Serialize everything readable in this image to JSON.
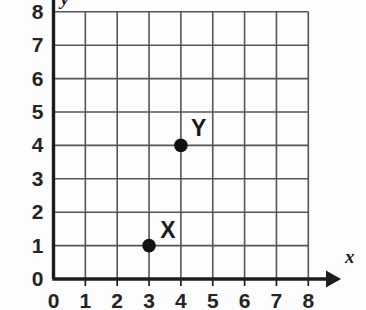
{
  "figure": {
    "kind": "coordinate-grid",
    "background_color": "#fdfdfd",
    "axis_color": "#1c1c1c",
    "grid_color": "#555555",
    "point_color": "#111111"
  },
  "chart_data": {
    "type": "scatter",
    "title": "",
    "subtitle": "",
    "xlabel": "x",
    "ylabel": "y",
    "xlim": [
      0,
      8
    ],
    "ylim": [
      0,
      8
    ],
    "xticks": [
      0,
      1,
      2,
      3,
      4,
      5,
      6,
      7,
      8
    ],
    "yticks": [
      0,
      1,
      2,
      3,
      4,
      5,
      6,
      7,
      8
    ],
    "xtick_labels": [
      "0",
      "1",
      "2",
      "3",
      "4",
      "5",
      "6",
      "7",
      "8"
    ],
    "ytick_labels": [
      "0",
      "1",
      "2",
      "3",
      "4",
      "5",
      "6",
      "7",
      "8"
    ],
    "grid": true,
    "grid_spacing": 1,
    "legend": false,
    "legend_position": "none",
    "axis_arrows": {
      "x": true,
      "y": false
    },
    "points": [
      {
        "label": "X",
        "x": 3,
        "y": 1,
        "label_dx": 0.35,
        "label_dy": 0.55
      },
      {
        "label": "Y",
        "x": 4,
        "y": 4,
        "label_dx": 0.32,
        "label_dy": 0.6
      }
    ],
    "series": [
      {
        "name": "plotted points",
        "x": [
          3,
          4
        ],
        "y": [
          1,
          4
        ],
        "labels": [
          "X",
          "Y"
        ]
      }
    ]
  },
  "axes": {
    "x_axis_name": "x",
    "y_axis_name": "y",
    "origin_label_x": "0",
    "origin_label_y": "0"
  }
}
